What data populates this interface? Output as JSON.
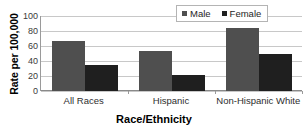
{
  "chart_data": {
    "type": "bar",
    "title": "",
    "xlabel": "Race/Ethnicity",
    "ylabel": "Rate per 100,000",
    "categories": [
      "All Races",
      "Hispanic",
      "Non-Hispanic White"
    ],
    "series": [
      {
        "name": "Male",
        "values": [
          67,
          53,
          84
        ],
        "color": "#4f4f4f"
      },
      {
        "name": "Female",
        "values": [
          35,
          21,
          50
        ],
        "color": "#1f1f1f"
      }
    ],
    "ylim": [
      0,
      100
    ],
    "yticks": [
      0,
      20,
      40,
      60,
      80,
      100
    ],
    "ytick_labels": [
      "0",
      "20",
      "40",
      "60",
      "80",
      "100"
    ],
    "grid": true,
    "legend_position": "top-right"
  },
  "legend": {
    "items": [
      {
        "label": "Male",
        "color": "#4f4f4f"
      },
      {
        "label": "Female",
        "color": "#1f1f1f"
      }
    ]
  }
}
